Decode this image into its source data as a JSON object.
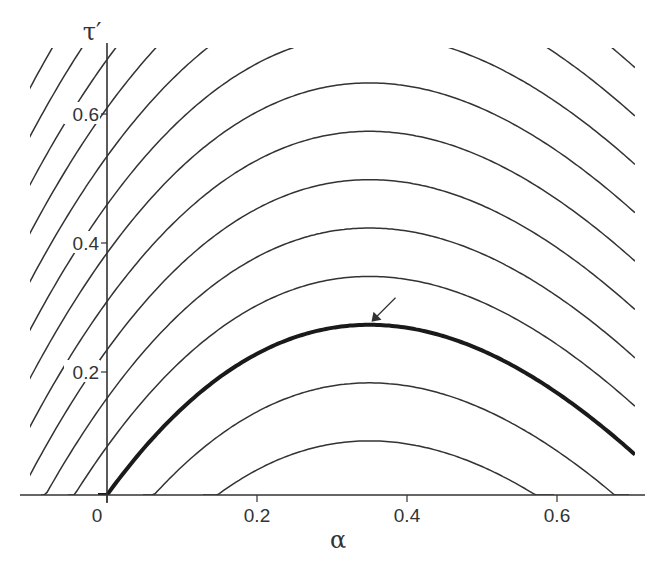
{
  "chart_data": {
    "type": "line",
    "title": "",
    "xlabel": "α",
    "ylabel": "τ′",
    "xlim": [
      -0.12,
      0.72
    ],
    "ylim": [
      0,
      0.7
    ],
    "grid": false,
    "legend": null,
    "x_ticks": [
      0,
      0.2,
      0.4,
      0.6
    ],
    "x_tick_labels": [
      "0",
      "0.2",
      "0.4",
      "0.6"
    ],
    "y_ticks": [
      0.2,
      0.4,
      0.6
    ],
    "y_tick_labels": [
      "0.2",
      "0.4",
      "0.6"
    ],
    "family": {
      "description": "Contour family τ′ = F(α) + c, F(α) = aα + bα² + cα³",
      "coeffs": {
        "a": 1.604,
        "b": -2.702,
        "c3": 0.781
      },
      "offsets": [
        -0.18,
        -0.09,
        0.0,
        0.075,
        0.15,
        0.225,
        0.3,
        0.375,
        0.45,
        0.525,
        0.6,
        0.675,
        0.75,
        0.825,
        0.9,
        0.975,
        1.05,
        1.125,
        1.2
      ],
      "highlighted_offset": 0.0
    },
    "annotations": [
      {
        "type": "arrow",
        "target": [
          0.35,
          0.264
        ],
        "text": "",
        "note": "arrow pointing to maximum of bold curve"
      }
    ],
    "series": [
      {
        "name": "highlighted contour (c = 0)",
        "x": [
          0,
          0.05,
          0.1,
          0.2,
          0.3,
          0.35,
          0.4,
          0.5,
          0.6,
          0.7
        ],
        "y": [
          0,
          0.074,
          0.134,
          0.219,
          0.259,
          0.264,
          0.259,
          0.224,
          0.16,
          0.067
        ],
        "bold": true
      }
    ]
  }
}
